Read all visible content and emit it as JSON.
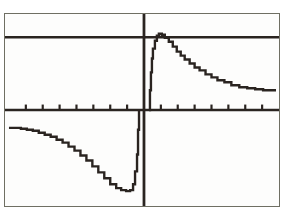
{
  "device": {
    "kind": "graphing-calculator-screen",
    "screen_background": "#fdfdfc",
    "screen_border_color": "#6f6f63",
    "page_background": "#ffffff",
    "ink_color": "#2a2420"
  },
  "chart_data": {
    "type": "line",
    "title": "",
    "subtitle": "",
    "xlabel": "",
    "ylabel": "",
    "grid": false,
    "legend": [],
    "legend_position": "none",
    "axes": {
      "x_axis_visible": true,
      "y_axis_visible": true,
      "x_axis_pixel_y": 110,
      "y_axis_pixel_x": 144,
      "x_tick_count_left": 8,
      "x_tick_count_right": 8,
      "x_tick_spacing_px": 17,
      "x_tick_length_px": 6,
      "y_tick_count": 0,
      "xlim": [
        -8.5,
        8.5
      ],
      "ylim": [
        -3.2,
        3.2
      ]
    },
    "annotations": [
      {
        "name": "horizontal-asymptote",
        "kind": "horizontal-line",
        "y_pixel": 36,
        "y_value": 2.0,
        "description": "horizontal line across full width near top of screen"
      },
      {
        "name": "vertical-asymptote",
        "kind": "vertical-line",
        "x_pixel": 144,
        "x_value": 0,
        "description": "vertical line at x = 0 spanning full screen height"
      }
    ],
    "series": [
      {
        "name": "left-branch",
        "style": "pixelated-stepped",
        "description": "decreasing from upper-left, falling to a minimum then rising steeply toward the vertical asymptote",
        "points_pixel": [
          [
            8,
            128
          ],
          [
            14,
            128
          ],
          [
            20,
            129
          ],
          [
            26,
            130
          ],
          [
            32,
            131
          ],
          [
            38,
            133
          ],
          [
            44,
            135
          ],
          [
            50,
            137
          ],
          [
            56,
            140
          ],
          [
            62,
            143
          ],
          [
            68,
            147
          ],
          [
            74,
            151
          ],
          [
            80,
            156
          ],
          [
            86,
            161
          ],
          [
            92,
            167
          ],
          [
            98,
            173
          ],
          [
            104,
            179
          ],
          [
            110,
            185
          ],
          [
            116,
            189
          ],
          [
            121,
            191
          ],
          [
            126,
            192
          ],
          [
            130,
            191
          ],
          [
            133,
            185
          ],
          [
            135,
            172
          ],
          [
            137,
            155
          ],
          [
            138,
            130
          ],
          [
            139,
            110
          ]
        ],
        "points_data": [
          [
            -8.0,
            -0.55
          ],
          [
            -7.0,
            -0.58
          ],
          [
            -6.0,
            -0.62
          ],
          [
            -5.0,
            -0.7
          ],
          [
            -4.0,
            -0.82
          ],
          [
            -3.0,
            -1.05
          ],
          [
            -2.2,
            -1.35
          ],
          [
            -1.6,
            -1.75
          ],
          [
            -1.1,
            -2.15
          ],
          [
            -0.8,
            -2.4
          ],
          [
            -0.6,
            -2.45
          ],
          [
            -0.45,
            -2.3
          ],
          [
            -0.3,
            -1.7
          ],
          [
            -0.18,
            -0.8
          ],
          [
            -0.08,
            0.0
          ]
        ]
      },
      {
        "name": "right-branch",
        "style": "pixelated-stepped",
        "description": "rising steeply from the vertical asymptote to a peak just above the horizontal line, then decaying toward the right edge",
        "points_pixel": [
          [
            149,
            110
          ],
          [
            150,
            90
          ],
          [
            151,
            72
          ],
          [
            152,
            58
          ],
          [
            153,
            48
          ],
          [
            155,
            40
          ],
          [
            157,
            35
          ],
          [
            159,
            33
          ],
          [
            162,
            34
          ],
          [
            165,
            37
          ],
          [
            169,
            41
          ],
          [
            173,
            46
          ],
          [
            177,
            51
          ],
          [
            181,
            55
          ],
          [
            185,
            59
          ],
          [
            190,
            63
          ],
          [
            195,
            67
          ],
          [
            200,
            70
          ],
          [
            206,
            74
          ],
          [
            212,
            77
          ],
          [
            218,
            80
          ],
          [
            225,
            82
          ],
          [
            232,
            85
          ],
          [
            240,
            87
          ],
          [
            248,
            88
          ],
          [
            256,
            89
          ],
          [
            264,
            90
          ],
          [
            272,
            90
          ],
          [
            277,
            90
          ]
        ],
        "points_data": [
          [
            0.08,
            0.0
          ],
          [
            0.2,
            1.1
          ],
          [
            0.35,
            1.8
          ],
          [
            0.5,
            2.1
          ],
          [
            0.7,
            2.15
          ],
          [
            0.9,
            2.05
          ],
          [
            1.2,
            1.85
          ],
          [
            1.6,
            1.6
          ],
          [
            2.0,
            1.42
          ],
          [
            2.6,
            1.22
          ],
          [
            3.2,
            1.08
          ],
          [
            4.0,
            0.95
          ],
          [
            5.0,
            0.84
          ],
          [
            6.0,
            0.78
          ],
          [
            7.0,
            0.74
          ],
          [
            8.0,
            0.72
          ]
        ]
      }
    ]
  }
}
